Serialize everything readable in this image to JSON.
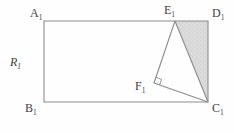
{
  "diagram": {
    "type": "geometry-figure",
    "colors": {
      "background": "#fefefe",
      "line": "#8c8c8c",
      "shade_fill": "#dcdcdc",
      "shade_dot": "#bfbfbf",
      "label_text": "#3f3f3f"
    },
    "vertex_labels": {
      "A": {
        "main": "A",
        "sub": "1"
      },
      "B": {
        "main": "B",
        "sub": "1"
      },
      "C": {
        "main": "C",
        "sub": "1"
      },
      "D": {
        "main": "D",
        "sub": "1"
      },
      "E": {
        "main": "E",
        "sub": "1"
      },
      "F": {
        "main": "F",
        "sub": "1"
      },
      "R": {
        "main": "R",
        "sub": "1"
      }
    },
    "points": {
      "A1": [
        44,
        21
      ],
      "D1": [
        208,
        21
      ],
      "C1": [
        208,
        102
      ],
      "B1": [
        44,
        102
      ],
      "E1": [
        175,
        21
      ],
      "F1": [
        154,
        83
      ]
    },
    "shapes": {
      "rectangle_points": "44,21 208,21 208,102 44,102",
      "shaded_triangle_points": "175,21 208,21 208,102",
      "triangle_path": "M175,21 L154,83 L208,102 Z",
      "right_angle_points": "155.9,77.3 161.6,79.3 159.6,85"
    }
  }
}
